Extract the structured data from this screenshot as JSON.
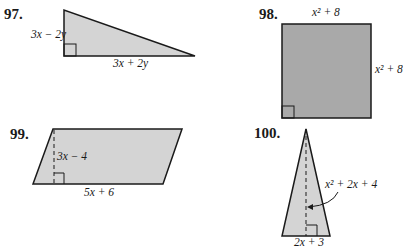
{
  "problems": [
    {
      "number": "97.",
      "shape": "right-triangle",
      "labels": {
        "height": "3x − 2y",
        "base": "3x + 2y"
      },
      "fill": "#d4d4d4"
    },
    {
      "number": "98.",
      "shape": "square",
      "labels": {
        "top": "x² + 8",
        "right": "x² + 8"
      },
      "fill": "#a9a9a9"
    },
    {
      "number": "99.",
      "shape": "parallelogram",
      "labels": {
        "height": "3x − 4",
        "base": "5x + 6"
      },
      "fill": "#d4d4d4"
    },
    {
      "number": "100.",
      "shape": "isosceles-triangle",
      "labels": {
        "height": "x² + 2x + 4",
        "base": "2x + 3"
      },
      "fill": "#d4d4d4"
    }
  ]
}
